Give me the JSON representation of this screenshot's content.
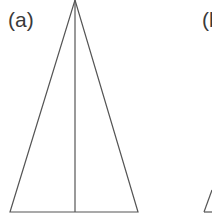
{
  "figure": {
    "panels": [
      {
        "label": "(a)",
        "label_pos": [
          8,
          27
        ],
        "shape": "isosceles-triangle",
        "apex": [
          75,
          0
        ],
        "base_left": [
          10,
          212
        ],
        "base_right": [
          138,
          212
        ],
        "median": {
          "from": [
            75,
            0
          ],
          "to": [
            75,
            212
          ]
        }
      },
      {
        "label": "(b",
        "label_pos": [
          202,
          27
        ],
        "shape": "triangle-partial",
        "visible_edge": {
          "from": [
            212,
            190
          ],
          "to": [
            204,
            212
          ]
        }
      }
    ],
    "stroke_color": "#555555",
    "background": "#ffffff"
  }
}
